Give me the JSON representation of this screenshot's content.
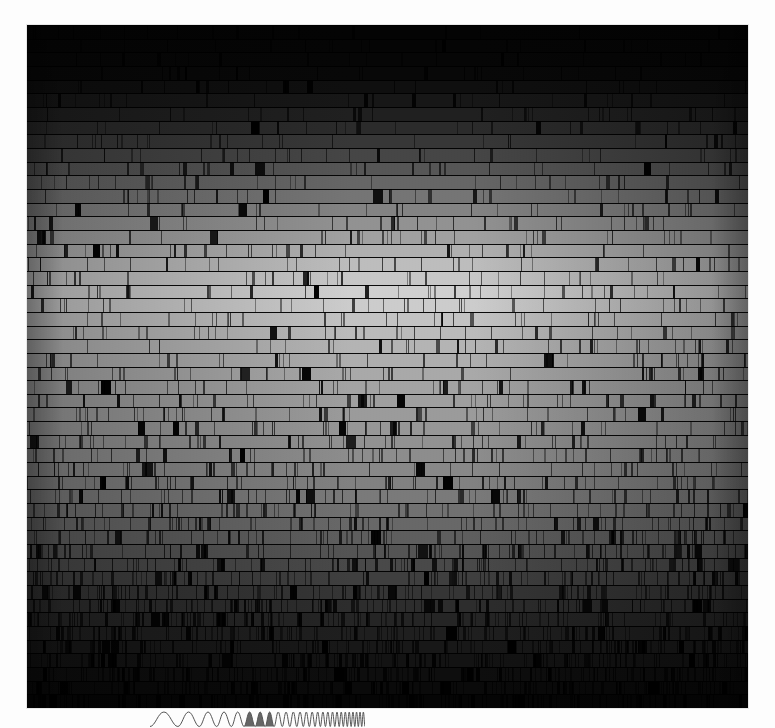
{
  "figure": {
    "kind": "solar-echelle-spectrum",
    "title": "",
    "caption": "",
    "plate": {
      "x": 27,
      "y": 25,
      "width": 721,
      "height": 683,
      "background_color": "#000000",
      "page_background": "#fdfdfd",
      "order_count": 50,
      "order_height_px": 13.66,
      "brightest_order_index": 19,
      "peak_gray": "#c8c8c8",
      "dark_gray": "#050505",
      "line_color": "#000000",
      "description": "Stacked echelle spectral orders of the Sun rendered in grayscale; each horizontal band is one diffraction order running blue (bottom) to red (top), crossed by dark Fraunhofer absorption lines."
    },
    "chirp_annotation": {
      "x": 150,
      "y": 708,
      "width": 215,
      "height": 20,
      "stroke_color": "#555555",
      "fill_color": "#4a4a4a",
      "cycles": 26,
      "filled_cycle_start": 5,
      "filled_cycle_end": 7,
      "description": "Frequency-increasing chirp waveform (arches) with three shaded humps near the left-centre."
    }
  },
  "chart_data": {
    "type": "heatmap",
    "xlabel": "Dispersion within order (wavelength increases left to right)",
    "ylabel": "Echelle order (wavelength increases bottom to top)",
    "legend": [],
    "grid": false,
    "x": [
      0,
      721
    ],
    "ylim": [
      0,
      50
    ],
    "categories": [
      "order-00",
      "order-01",
      "order-02",
      "order-03",
      "order-04",
      "order-05",
      "order-06",
      "order-07",
      "order-08",
      "order-09",
      "order-10",
      "order-11",
      "order-12",
      "order-13",
      "order-14",
      "order-15",
      "order-16",
      "order-17",
      "order-18",
      "order-19",
      "order-20",
      "order-21",
      "order-22",
      "order-23",
      "order-24",
      "order-25",
      "order-26",
      "order-27",
      "order-28",
      "order-29",
      "order-30",
      "order-31",
      "order-32",
      "order-33",
      "order-34",
      "order-35",
      "order-36",
      "order-37",
      "order-38",
      "order-39",
      "order-40",
      "order-41",
      "order-42",
      "order-43",
      "order-44",
      "order-45",
      "order-46",
      "order-47",
      "order-48",
      "order-49"
    ],
    "series": [
      {
        "name": "mean order brightness (0-255)",
        "values": [
          4,
          5,
          6,
          8,
          14,
          22,
          30,
          41,
          52,
          66,
          81,
          96,
          110,
          124,
          138,
          152,
          166,
          178,
          188,
          196,
          192,
          184,
          176,
          170,
          164,
          159,
          154,
          150,
          146,
          142,
          138,
          133,
          128,
          122,
          115,
          107,
          98,
          89,
          79,
          69,
          59,
          50,
          42,
          35,
          29,
          23,
          18,
          13,
          9,
          5
        ]
      },
      {
        "name": "absorption line density (lines per order)",
        "values": [
          18,
          19,
          20,
          22,
          24,
          25,
          27,
          28,
          29,
          30,
          31,
          31,
          32,
          32,
          33,
          33,
          34,
          34,
          34,
          35,
          35,
          36,
          37,
          38,
          39,
          40,
          42,
          44,
          46,
          48,
          51,
          54,
          58,
          62,
          67,
          72,
          78,
          84,
          91,
          98,
          106,
          114,
          122,
          130,
          138,
          146,
          152,
          158,
          163,
          168
        ]
      }
    ],
    "annotations": [
      {
        "name": "chirp-waveform",
        "x": 150,
        "y": 708,
        "text": ""
      }
    ]
  }
}
